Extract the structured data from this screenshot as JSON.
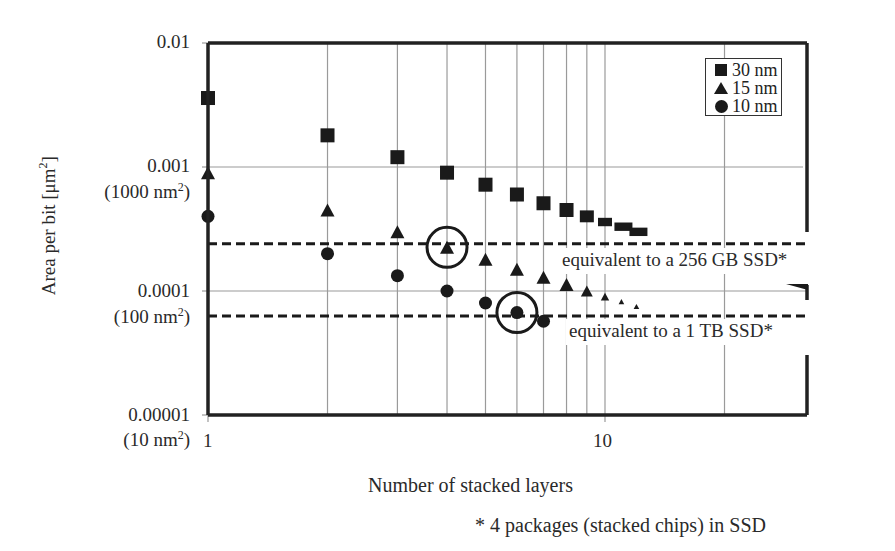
{
  "chart_data": {
    "type": "scatter",
    "title": "",
    "xlabel": "Number of stacked layers",
    "ylabel": "Area per bit [μm²]",
    "x_scale": "log",
    "y_scale": "log",
    "xlim": [
      1,
      25
    ],
    "ylim": [
      1e-05,
      0.01
    ],
    "x_ticks": [
      {
        "value": 1,
        "label": "1"
      },
      {
        "value": 10,
        "label": "10"
      }
    ],
    "y_ticks": [
      {
        "value": 0.01,
        "label": "0.01",
        "sublabel": ""
      },
      {
        "value": 0.001,
        "label": "0.001",
        "sublabel": "(1000 nm²)"
      },
      {
        "value": 0.0001,
        "label": "0.0001",
        "sublabel": "(100 nm²)"
      },
      {
        "value": 1e-05,
        "label": "0.00001",
        "sublabel": "(10 nm²)"
      }
    ],
    "grid": true,
    "legend_position": "upper right",
    "series": [
      {
        "name": "30 nm",
        "marker": "square",
        "x": [
          1,
          2,
          3,
          4,
          5,
          6,
          7,
          8,
          9,
          10,
          11,
          12
        ],
        "values": [
          0.0036,
          0.0018,
          0.0012,
          0.0009,
          0.00072,
          0.0006,
          0.00051,
          0.00045,
          0.0004,
          0.00036,
          0.00033,
          0.0003
        ]
      },
      {
        "name": "15 nm",
        "marker": "triangle",
        "x": [
          1,
          2,
          3,
          4,
          5,
          6,
          7,
          8,
          9,
          10,
          11,
          12
        ],
        "values": [
          0.0009,
          0.00045,
          0.0003,
          0.000225,
          0.00018,
          0.00015,
          0.000129,
          0.000113,
          0.0001,
          9e-05,
          8.2e-05,
          7.5e-05
        ]
      },
      {
        "name": "10 nm",
        "marker": "circle",
        "x": [
          1,
          2,
          3,
          4,
          5,
          6,
          7
        ],
        "values": [
          0.0004,
          0.0002,
          0.000133,
          0.0001,
          8e-05,
          6.7e-05,
          5.7e-05
        ]
      }
    ],
    "reference_lines": [
      {
        "label": "equivalent to a 256 GB SSD*",
        "value": 0.00024,
        "style": "dashed"
      },
      {
        "label": "equivalent to a 1 TB SSD*",
        "value": 6.3e-05,
        "style": "dashed"
      }
    ],
    "highlights": [
      {
        "series": "15 nm",
        "x": 4,
        "value": 0.000225,
        "shape": "circle"
      },
      {
        "series": "10 nm",
        "x": 6,
        "value": 6.7e-05,
        "shape": "circle"
      }
    ],
    "annotations": [
      "* 4 packages (stacked chips) in SSD"
    ]
  },
  "labels": {
    "ylabel": "Area per bit [μm",
    "ylabel_sup": "2",
    "ylabel_end": "]",
    "xlabel": "Number of stacked layers",
    "footnote": "* 4 packages (stacked chips) in SSD",
    "ref256": "equivalent to a 256 GB SSD*",
    "ref1tb": "equivalent to a 1 TB SSD*",
    "y0": "0.01",
    "y1": "0.001",
    "y1sub": "(1000 nm",
    "y2": "0.0001",
    "y2sub": "(100 nm",
    "y3": "0.00001",
    "y3sub": "(10 nm",
    "sup2": "2",
    "close": ")",
    "x1": "1",
    "x10": "10",
    "legend": [
      "30 nm",
      "15 nm",
      "10 nm"
    ]
  },
  "colors": {
    "ink": "#1a1a1a",
    "grid": "#9a9a9a",
    "frame": "#222222"
  }
}
